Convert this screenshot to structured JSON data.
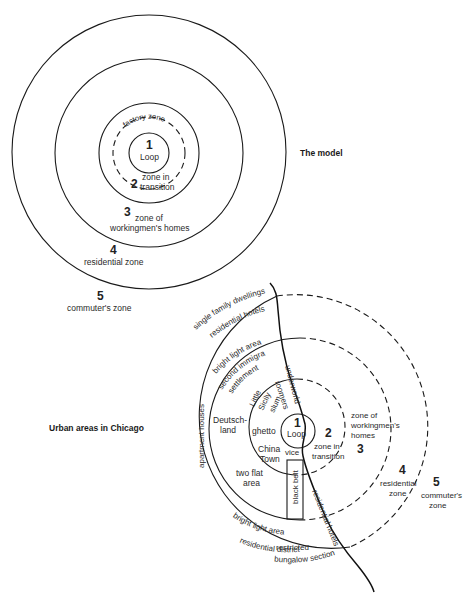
{
  "model": {
    "title": "The model",
    "center": [
      149,
      153
    ],
    "rings": [
      {
        "r": 20,
        "style": "solid"
      },
      {
        "r": 36,
        "style": "dashed"
      },
      {
        "r": 50,
        "style": "solid"
      },
      {
        "r": 94,
        "style": "solid"
      },
      {
        "r": 137,
        "style": "solid"
      }
    ],
    "labels": {
      "zone1_num": "1",
      "zone1_name": "Loop",
      "factory": "factory zone",
      "zone2_num": "2",
      "zone2_line1": "zone in",
      "zone2_line2": "transition",
      "zone3_num": "3",
      "zone3_line1": "zone of",
      "zone3_line2": "workingmen's homes",
      "zone4_num": "4",
      "zone4_name": "residential zone",
      "zone5_num": "5",
      "zone5_name": "commuter's zone"
    }
  },
  "chicago": {
    "title": "Urban areas in Chicago",
    "center": [
      299,
      427
    ],
    "rings": [
      {
        "r": 17,
        "style": "solid"
      },
      {
        "r": 48,
        "style": "half"
      },
      {
        "r": 91,
        "style": "half"
      },
      {
        "r": 132,
        "style": "half"
      }
    ],
    "labels": {
      "zone1_num": "1",
      "zone1_name": "Loop",
      "zone2_num": "2",
      "zone2_line1": "zone in",
      "zone2_line2": "transition",
      "zone3_num": "3",
      "zone3_line1": "zone of",
      "zone3_line2": "workingmen's",
      "zone3_line3": "homes",
      "zone4_num": "4",
      "zone4_line1": "residential",
      "zone4_line2": "zone",
      "zone5_num": "5",
      "zone5_line1": "commuter's",
      "zone5_line2": "zone",
      "single_family": "single family dwellings",
      "residential_hotels_top": "residential hotels",
      "bright_light_top": "bright light area",
      "second_immigrant": "second immigrant",
      "settlement": "settlement",
      "apartment_houses": "apartment houses",
      "deutschland_1": "Deutsch-",
      "deutschland_2": "land",
      "little": "Little",
      "sicily": "Sicily",
      "slum": "slum",
      "roomers": "roomers",
      "underworld": "underworld",
      "ghetto": "ghetto",
      "china": "China",
      "town": "Town",
      "vice": "vice",
      "two_flat_1": "two flat",
      "two_flat_2": "area",
      "black_belt": "black belt",
      "residential_hotels_bottom": "residential hotels",
      "bright_light_bottom": "bright light area",
      "restricted_1": "restricted",
      "restricted_2": "residential district",
      "bungalow": "bungalow section"
    }
  }
}
